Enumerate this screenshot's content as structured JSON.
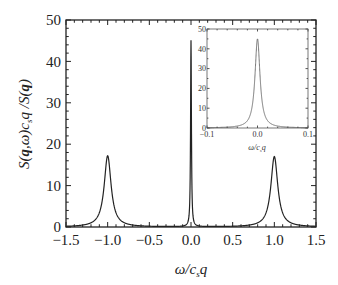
{
  "chart_data": [
    {
      "type": "line",
      "role": "main",
      "title": "",
      "xlabel": "ω/c_s q",
      "ylabel": "S(q,ω)c_s q /S(q)",
      "xlim": [
        -1.5,
        1.5
      ],
      "ylim": [
        0,
        50
      ],
      "xticks": [
        "-1.5",
        "-1.0",
        "-0.5",
        "0.0",
        "0.5",
        "1.0",
        "1.5"
      ],
      "yticks": [
        "0",
        "10",
        "20",
        "30",
        "40",
        "50"
      ],
      "grid": false,
      "legend": null,
      "series": [
        {
          "name": "S(q,ω)",
          "peaks": [
            {
              "x": -1.0,
              "y": 17.2,
              "width": 0.05
            },
            {
              "x": 0.0,
              "y": 45.0,
              "width": 0.006
            },
            {
              "x": 1.0,
              "y": 17.0,
              "width": 0.05
            }
          ]
        }
      ]
    },
    {
      "type": "line",
      "role": "inset",
      "xlabel": "ω/c_s q",
      "ylabel": "",
      "xlim": [
        -0.1,
        0.1
      ],
      "ylim": [
        0,
        50
      ],
      "xticks": [
        "-0.1",
        "0.0",
        "0.1"
      ],
      "yticks": [
        "0",
        "10",
        "20",
        "30",
        "40",
        "50"
      ],
      "series": [
        {
          "name": "central peak",
          "peaks": [
            {
              "x": 0.0,
              "y": 45.0,
              "width": 0.006
            }
          ]
        }
      ]
    }
  ],
  "labels": {
    "ylabel_parts": [
      "S(",
      "q",
      ",ω)c",
      "s",
      "q /S(",
      "q",
      ")"
    ],
    "xlabel_main": "ω/c",
    "xlabel_sub": "s",
    "xlabel_q": "q"
  }
}
